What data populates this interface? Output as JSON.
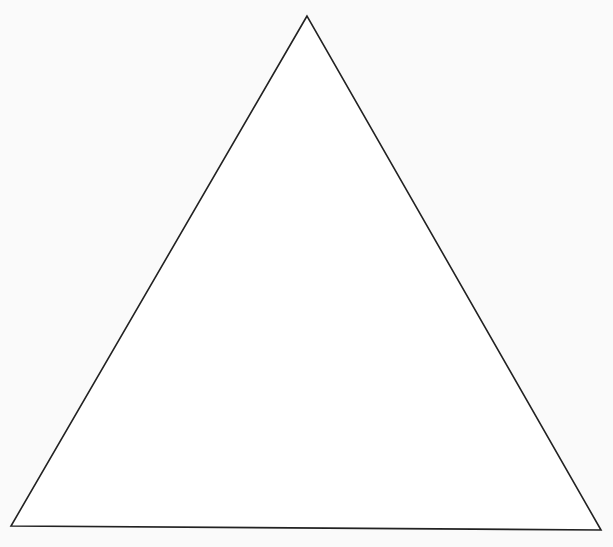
{
  "diagram": {
    "shape": "triangle",
    "vertices": [
      {
        "name": "apex",
        "x": 307,
        "y": 16
      },
      {
        "name": "bottom-left",
        "x": 11,
        "y": 526
      },
      {
        "name": "bottom-right",
        "x": 601,
        "y": 530
      }
    ],
    "fill": "#ffffff",
    "stroke": "#222222",
    "stroke_width": 1.6,
    "background": "#fafafa"
  }
}
